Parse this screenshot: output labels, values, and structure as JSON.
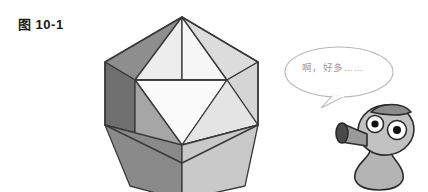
{
  "figure": {
    "label": "图 10-1"
  },
  "speech": {
    "text": "啊，好多……",
    "bubble_stroke": "#b8b8b8",
    "bubble_fill": "#ffffff",
    "text_color": "#9a9a9a"
  },
  "solid": {
    "name": "icosahedron",
    "caption_color": "#1a1a1a",
    "edge_color": "#3a3a3a",
    "faces": [
      {
        "id": "top-left-upper",
        "tone": "#8e8e8e"
      },
      {
        "id": "top-center-upper",
        "tone": "#f7f7f7"
      },
      {
        "id": "top-right-upper",
        "tone": "#dcdcdc"
      },
      {
        "id": "left-upper",
        "tone": "#9c9c9c"
      },
      {
        "id": "left-dark-edge",
        "tone": "#6f6f6f"
      },
      {
        "id": "center-main",
        "tone": "#fbfbfb"
      },
      {
        "id": "right-upper",
        "tone": "#d5d5d5"
      },
      {
        "id": "left-lower",
        "tone": "#9a9a9a"
      },
      {
        "id": "center-lower",
        "tone": "#fafafa"
      },
      {
        "id": "right-lower",
        "tone": "#d2d2d2"
      },
      {
        "id": "bottom-left",
        "tone": "#8a8a8a"
      },
      {
        "id": "bottom-right",
        "tone": "#c9c9c9"
      }
    ],
    "palette": {
      "highlight": "#fbfbfb",
      "light": "#d8d8d8",
      "mid": "#9a9a9a",
      "dark": "#6f6f6f"
    }
  },
  "character": {
    "name": "peashooter",
    "body_fill": "#b4b4b4",
    "body_stroke": "#2b2b2b",
    "head_fill": "#c2c2c2",
    "cap_fill": "#8c8c8c",
    "muzzle_fill": "#9a9a9a",
    "muzzle_inner": "#4a4a4a",
    "eye_white": "#ffffff",
    "pupil": "#121212"
  }
}
